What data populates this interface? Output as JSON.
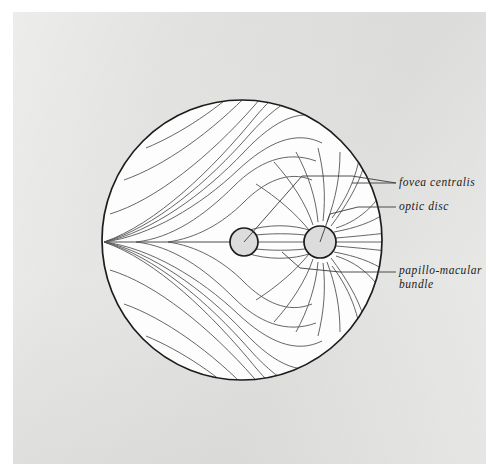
{
  "figure": {
    "background_color": "#e3e3e1",
    "ink_color": "#3a3a3a",
    "outline_color": "#1c1c1c",
    "disc_fill_color": "#d9d9d9",
    "labels": {
      "fovea": "fovea centralis",
      "optic_disc": "optic disc",
      "papillo_macular_line1": "papillo-macular",
      "papillo_macular_line2": "bundle"
    }
  },
  "geometry": {
    "retina_circle": {
      "cx": 242,
      "cy": 240,
      "r": 140
    },
    "fovea": {
      "cx": 244,
      "cy": 242,
      "r": 14
    },
    "optic_disc": {
      "cx": 320,
      "cy": 242,
      "r": 16
    },
    "raphe_point": {
      "x": 104,
      "y": 242
    },
    "leader_lines": [
      {
        "name": "fovea-leader",
        "x1": 352,
        "y1": 183,
        "x2": 396,
        "y2": 183
      },
      {
        "name": "optic-disc-leader",
        "x1": 358,
        "y1": 207,
        "x2": 396,
        "y2": 207
      },
      {
        "name": "papillo-macular-leader",
        "x1": 340,
        "y1": 272,
        "x2": 396,
        "y2": 272
      }
    ]
  }
}
